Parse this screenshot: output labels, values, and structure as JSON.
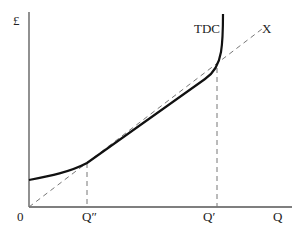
{
  "diagram": {
    "y_axis_label": "£",
    "x_axis_label": "Q",
    "origin_label": "0",
    "curve_label": "TDC",
    "ray_label": "X",
    "q_double_prime_label": "Q″",
    "q_prime_label": "Q′",
    "colors": {
      "axis": "#555555",
      "curve": "#111111",
      "dashed": "#777777",
      "background": "#ffffff"
    }
  }
}
